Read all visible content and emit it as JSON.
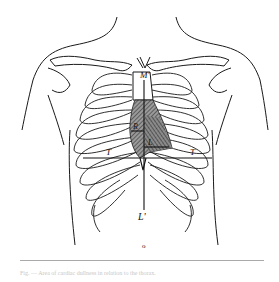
{
  "figure": {
    "labels": {
      "top_sternum": "M'",
      "bottom_midline": "L'",
      "left_horizontal": "T",
      "right_horizontal": "T",
      "left_area": "R",
      "lower_area": "L"
    },
    "marker": "o",
    "colors": {
      "line": "#1a1a1a",
      "hatch": "#555555",
      "background": "#ffffff",
      "rule": "#aaaaaa"
    }
  },
  "caption": {
    "text": "Fig. — Area of cardiac dullness in relation to the thorax."
  }
}
